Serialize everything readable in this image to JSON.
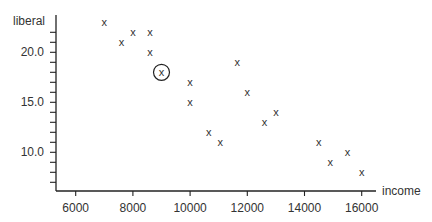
{
  "chart_data": {
    "type": "scatter",
    "title": "",
    "xlabel": "income",
    "ylabel": "liberal",
    "xlim": [
      5300,
      16500
    ],
    "ylim": [
      6.1,
      23.7
    ],
    "grid": false,
    "legend": null,
    "x_ticks": [
      6000,
      8000,
      10000,
      12000,
      14000,
      16000
    ],
    "x_tick_labels": [
      "6000",
      "8000",
      "10000",
      "12000",
      "14000",
      "16000"
    ],
    "y_ticks": [
      7,
      8,
      9,
      10,
      11,
      12,
      13,
      14,
      15,
      16,
      17,
      18,
      19,
      20,
      21,
      22
    ],
    "y_tick_labels": [
      {
        "value": 10,
        "label": "10.0"
      },
      {
        "value": 15,
        "label": "15.0"
      },
      {
        "value": 20,
        "label": "20.0"
      }
    ],
    "marker": "x",
    "points": [
      {
        "x": 7000,
        "y": 23.0
      },
      {
        "x": 7600,
        "y": 21.0
      },
      {
        "x": 8000,
        "y": 22.0
      },
      {
        "x": 8600,
        "y": 22.0
      },
      {
        "x": 8600,
        "y": 20.0
      },
      {
        "x": 9000,
        "y": 18.0,
        "highlighted": true
      },
      {
        "x": 10000,
        "y": 17.0
      },
      {
        "x": 10000,
        "y": 15.0
      },
      {
        "x": 11650,
        "y": 19.0
      },
      {
        "x": 12000,
        "y": 16.0
      },
      {
        "x": 10650,
        "y": 12.0
      },
      {
        "x": 11050,
        "y": 11.0
      },
      {
        "x": 12600,
        "y": 13.0
      },
      {
        "x": 13000,
        "y": 14.0
      },
      {
        "x": 14500,
        "y": 11.0
      },
      {
        "x": 14900,
        "y": 9.0
      },
      {
        "x": 15500,
        "y": 10.0
      },
      {
        "x": 16000,
        "y": 8.0
      }
    ],
    "annotations": [
      {
        "type": "circle",
        "x": 9000,
        "y": 18.0,
        "note": "circled point"
      }
    ]
  },
  "labels": {
    "xlabel": "income",
    "ylabel": "liberal",
    "marker_glyph": "x"
  }
}
